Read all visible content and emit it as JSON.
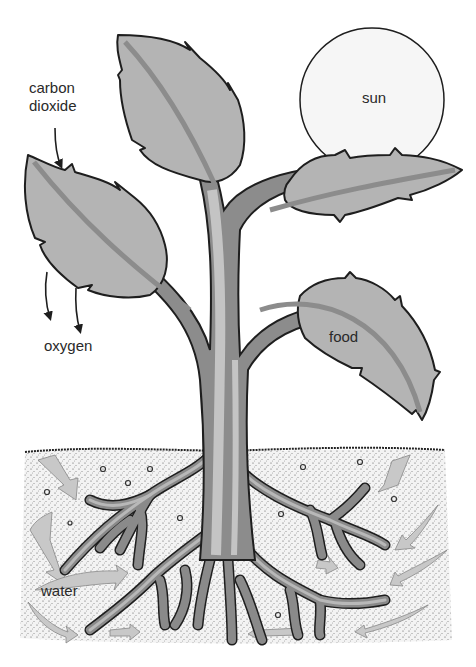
{
  "diagram": {
    "labels": {
      "carbon_dioxide_line1": "carbon",
      "carbon_dioxide_line2": "dioxide",
      "oxygen": "oxygen",
      "sun": "sun",
      "food": "food",
      "water": "water"
    },
    "parts": [
      "sun",
      "leaves",
      "stem",
      "roots",
      "soil",
      "water arrows",
      "gas arrows"
    ],
    "colors": {
      "leaf_fill": "#b4b4b4",
      "stem_outer": "#8c8c8c",
      "stem_inner": "#c4c4c4",
      "outline": "#1e1e1e",
      "sun_fill": "#f6f6f6",
      "soil_fill": "#f4f4f4",
      "soil_dots": "#5a5a5a",
      "water_arrow": "#c8c8c8",
      "background": "#ffffff"
    }
  }
}
